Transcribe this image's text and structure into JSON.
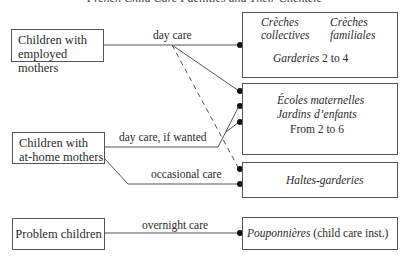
{
  "title": "French Child Care Facilities and Their Clientele",
  "clients": [
    {
      "line1": "Children with",
      "line2": "employed mothers"
    },
    {
      "line1": "Children with",
      "line2": "at-home mothers"
    },
    {
      "line1": "Problem children"
    }
  ],
  "edges": {
    "day_care": "day care",
    "day_care_if_wanted": "day care, if wanted",
    "occasional_care": "occasional care",
    "overnight_care": "overnight care"
  },
  "facilities": {
    "a": {
      "creches_collectives_1": "Crèches",
      "creches_collectives_2": "collectives",
      "creches_familiales_1": "Crèches",
      "creches_familiales_2": "familiales",
      "garderies": "Garderies",
      "ages": "2 to 4"
    },
    "b": {
      "ecoles": "Écoles maternelles",
      "jardins": "Jardins d’enfants",
      "ages": "From 2 to 6"
    },
    "c": {
      "name": "Haltes-garderies"
    },
    "d": {
      "name": "Pouponnières",
      "note": "(child care inst.)"
    }
  },
  "colors": {
    "line": "#555555",
    "dot": "#111111",
    "text": "#2a2a2a"
  }
}
